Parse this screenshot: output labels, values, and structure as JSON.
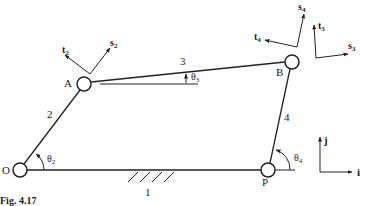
{
  "figure": {
    "caption": "Fig. 4.17",
    "type": "four-bar linkage diagram"
  },
  "joints": {
    "O": "O",
    "A": "A",
    "B": "B",
    "P": "P"
  },
  "links": {
    "ground": "1",
    "crank": "2",
    "coupler": "3",
    "rocker": "4"
  },
  "angles": {
    "theta2": {
      "symbol": "θ",
      "sub": "2"
    },
    "theta3": {
      "symbol": "θ",
      "sub": "3"
    },
    "theta4": {
      "symbol": "θ",
      "sub": "4"
    }
  },
  "unit_vectors": {
    "t2": {
      "symbol": "t",
      "sub": "2"
    },
    "s2": {
      "symbol": "s",
      "sub": "2"
    },
    "t3": {
      "symbol": "t",
      "sub": "3"
    },
    "s3": {
      "symbol": "s",
      "sub": "3"
    },
    "t4": {
      "symbol": "t",
      "sub": "4"
    },
    "s4": {
      "symbol": "s",
      "sub": "4"
    },
    "i": "i",
    "j": "j"
  },
  "colors": {
    "ink": "#222222",
    "background": "#ffffff"
  }
}
